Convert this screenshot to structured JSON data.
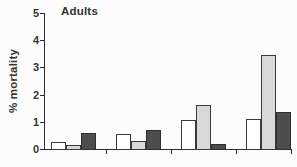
{
  "chart_data": {
    "type": "bar",
    "title": "Adults",
    "xlabel": "",
    "ylabel": "% mortality",
    "ylim": [
      0,
      5
    ],
    "yticks": [
      0,
      1,
      2,
      3,
      4,
      5
    ],
    "grid": false,
    "legend": "none",
    "categories": [
      "group-1",
      "group-2",
      "group-3",
      "group-4"
    ],
    "series": [
      {
        "name": "white-bars",
        "color": "#ffffff",
        "values": [
          0.25,
          0.55,
          1.05,
          1.1
        ]
      },
      {
        "name": "light-gray-bars",
        "color": "#d9d9d9",
        "values": [
          0.15,
          0.3,
          1.6,
          3.45
        ]
      },
      {
        "name": "dark-gray-bars",
        "color": "#4d4d4d",
        "values": [
          0.6,
          0.7,
          0.2,
          1.35
        ]
      }
    ],
    "bar_outline_color": "#3a3a3a",
    "axis_color": "#2b2b2b"
  }
}
